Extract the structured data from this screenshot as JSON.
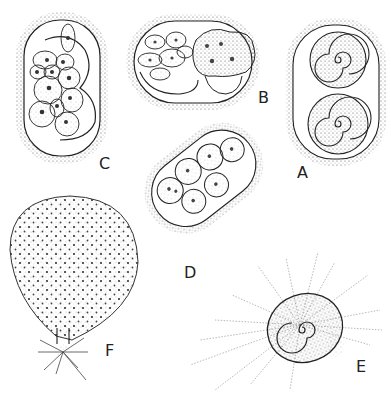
{
  "figure": {
    "type": "scientific-illustration",
    "panels": [
      {
        "id": "A",
        "label": "A",
        "description": "oval cyst with two coiled organisms"
      },
      {
        "id": "B",
        "label": "B",
        "description": "cyst with cluster of cells and large multinucleate cell"
      },
      {
        "id": "C",
        "label": "C",
        "description": "oval cyst containing many nucleated cells"
      },
      {
        "id": "D",
        "label": "D",
        "description": "elongated cyst with several rounded curled cells"
      },
      {
        "id": "E",
        "label": "E",
        "description": "coiled cell with radiating fine filaments"
      },
      {
        "id": "F",
        "label": "F",
        "description": "large round dotted body with rhizoid-like base"
      }
    ],
    "colors": {
      "ink": "#222222",
      "stipple": "#555555",
      "background": "#ffffff"
    }
  }
}
